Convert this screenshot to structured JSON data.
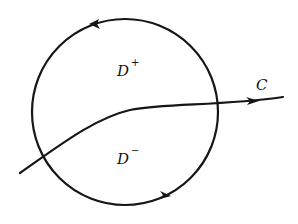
{
  "diagram": {
    "type": "contour-partition",
    "stroke_color": "#161616",
    "background": "#ffffff",
    "circle": {
      "cx": 125,
      "cy": 112,
      "r": 93,
      "orientation": "counterclockwise",
      "arrows": [
        {
          "position": "top-left",
          "x": 95,
          "y": 24,
          "direction": "left"
        },
        {
          "position": "bottom",
          "x": 166,
          "y": 198,
          "direction": "right"
        }
      ]
    },
    "curve": {
      "name": "C",
      "path": "M 20 173 C 60 145, 95 118, 130 110 C 165 103, 220 106, 283 97",
      "arrow": {
        "x": 255,
        "y": 101,
        "direction": "right"
      }
    },
    "labels": {
      "upper_region": {
        "base": "D",
        "sup": "+",
        "x": 117,
        "y": 76
      },
      "lower_region": {
        "base": "D",
        "sup": "−",
        "x": 117,
        "y": 164
      },
      "curve_label": {
        "text": "C",
        "x": 256,
        "y": 90
      }
    }
  }
}
